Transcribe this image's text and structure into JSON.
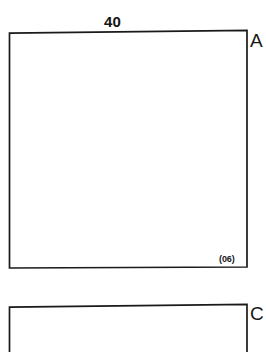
{
  "drawing": {
    "background_color": "#ffffff",
    "stroke_color": "#1a1a1a",
    "shapes": {
      "upper_rectangle": {
        "name": "rectangle-a",
        "top_left": [
          9,
          33
        ],
        "top_right": [
          247,
          30
        ],
        "bottom_right": [
          247,
          267
        ],
        "bottom_left": [
          9,
          268
        ]
      },
      "lower_rectangle": {
        "name": "rectangle-c",
        "top_left": [
          9,
          307
        ],
        "top_right": [
          247,
          304
        ],
        "bottom_right": [
          247,
          352
        ],
        "bottom_left": [
          9,
          352
        ],
        "cropped_at_bottom": true
      }
    },
    "labels": {
      "dimension_top": "40",
      "vertex_a": "A",
      "vertex_c": "C",
      "corner_note": "(06)"
    }
  }
}
